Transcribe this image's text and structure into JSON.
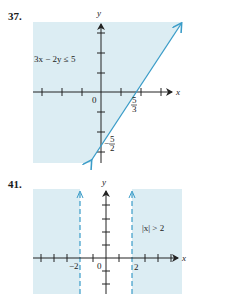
{
  "problems": [
    {
      "number": "37.",
      "inequality": "3x − 2y ≤ 5",
      "axis_x": "x",
      "axis_y": "y",
      "origin": "0",
      "x_intercept_num": "5",
      "x_intercept_den": "3",
      "y_intercept_sign": "−",
      "y_intercept_num": "5",
      "y_intercept_den": "2"
    },
    {
      "number": "41.",
      "inequality": "|x| > 2",
      "axis_x": "x",
      "axis_y": "y",
      "origin": "0",
      "left_boundary": "−2",
      "right_boundary": "2"
    }
  ],
  "colors": {
    "shade": "#dcedf3",
    "line": "#3a9cc8",
    "axis": "#222222"
  }
}
